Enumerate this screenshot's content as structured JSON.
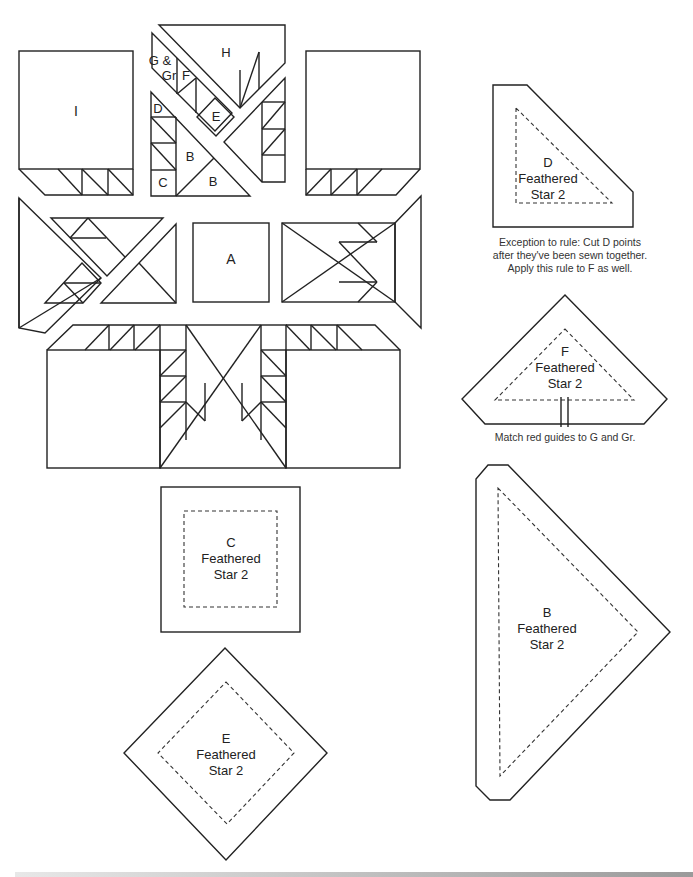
{
  "diagram": {
    "block_labels": {
      "I": "I",
      "H": "H",
      "G_Gr_line1": "G &",
      "G_Gr_line2": "Gr",
      "F": "F",
      "E": "E",
      "D": "D",
      "B1": "B",
      "B2": "B",
      "C": "C",
      "A": "A"
    },
    "templates": {
      "D": {
        "letter": "D",
        "line2": "Feathered",
        "line3": "Star 2"
      },
      "F": {
        "letter": "F",
        "line2": "Feathered",
        "line3": "Star 2"
      },
      "B": {
        "letter": "B",
        "line2": "Feathered",
        "line3": "Star 2"
      },
      "C": {
        "letter": "C",
        "line2": "Feathered",
        "line3": "Star 2"
      },
      "E": {
        "letter": "E",
        "line2": "Feathered",
        "line3": "Star 2"
      }
    },
    "notes": {
      "d_line1": "Exception to rule: Cut D points",
      "d_line2": "after they've been sewn together.",
      "d_line3": "Apply this rule to F as well.",
      "f_line1": "Match red guides to G and Gr."
    }
  }
}
